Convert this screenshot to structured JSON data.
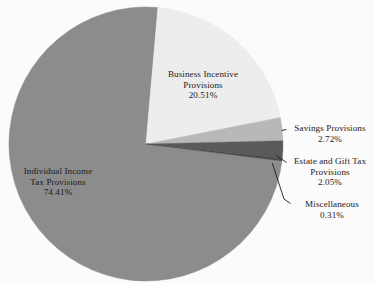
{
  "chart_data": {
    "type": "pie",
    "title": "",
    "subtitle": "",
    "xlabel": "",
    "ylabel": "",
    "legend_position": "none",
    "grid": false,
    "labels_show_percent": true,
    "categories": [
      "Business Incentive Provisions",
      "Savings Provisions",
      "Estate and Gift Tax Provisions",
      "Miscellaneous",
      "Individual Income Tax Provisions"
    ],
    "values": [
      20.51,
      2.72,
      2.05,
      0.31,
      74.41
    ],
    "value_labels": [
      "20.51%",
      "2.72%",
      "2.05%",
      "0.31%",
      "74.41%"
    ],
    "colors": [
      "#ededed",
      "#b8b8b8",
      "#5a5a5a",
      "#4a4a4a",
      "#8c8c8c"
    ],
    "slices": [
      {
        "name": "Business Incentive Provisions",
        "name_line1": "Business Incentive",
        "name_line2": "Provisions",
        "value": 20.51,
        "value_label": "20.51%",
        "color": "#ededed",
        "label_placement": "inside"
      },
      {
        "name": "Savings Provisions",
        "name_line1": "Savings Provisions",
        "name_line2": "",
        "value": 2.72,
        "value_label": "2.72%",
        "color": "#b8b8b8",
        "label_placement": "outside-leader"
      },
      {
        "name": "Estate and Gift Tax Provisions",
        "name_line1": "Estate and Gift Tax",
        "name_line2": "Provisions",
        "value": 2.05,
        "value_label": "2.05%",
        "color": "#5a5a5a",
        "label_placement": "outside-leader"
      },
      {
        "name": "Miscellaneous",
        "name_line1": "Miscellaneous",
        "name_line2": "",
        "value": 0.31,
        "value_label": "0.31%",
        "color": "#4a4a4a",
        "label_placement": "outside-leader"
      },
      {
        "name": "Individual Income Tax Provisions",
        "name_line1": "Individual Income",
        "name_line2": "Tax Provisions",
        "value": 74.41,
        "value_label": "74.41%",
        "color": "#8c8c8c",
        "label_placement": "inside"
      }
    ],
    "total": 100.0,
    "background_color": "#fbfbfb",
    "text_color": "#1a1a1a",
    "leader_line_color": "#1a1a1a"
  }
}
